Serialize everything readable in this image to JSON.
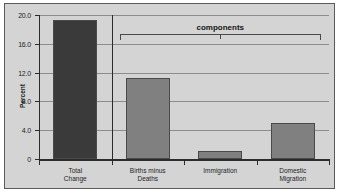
{
  "chart_data": {
    "type": "bar",
    "title": "",
    "xlabel": "",
    "ylabel": "Percent",
    "categories": [
      "Total\nChange",
      "Births minus\nDeaths",
      "Immigration",
      "Domestic\nMigration"
    ],
    "values": [
      19.3,
      11.3,
      1.1,
      5.0
    ],
    "ylim": [
      0,
      20
    ],
    "yticks": [
      0,
      4,
      8,
      12,
      16,
      20
    ],
    "ytick_labels": [
      "0",
      "4.0",
      "8.0",
      "12.0",
      "16.0",
      "20.0"
    ],
    "grid": true,
    "legend": false,
    "bar_colors": [
      "#3a3a3a",
      "#808080",
      "#808080",
      "#808080"
    ],
    "annotations": [
      {
        "text": "components",
        "spans": [
          "Births minus\nDeaths",
          "Immigration",
          "Domestic\nMigration"
        ]
      }
    ]
  },
  "colors": {
    "panel_background": "#d4d4d4",
    "panel_border": "#5a5a5a",
    "gridline": "#8d8d8d",
    "axis": "#2b2b2b",
    "bar_dark": "#3a3a3a",
    "bar_light": "#808080",
    "bar_edge": "#4a4a4a",
    "text": "#1e1e1e"
  }
}
